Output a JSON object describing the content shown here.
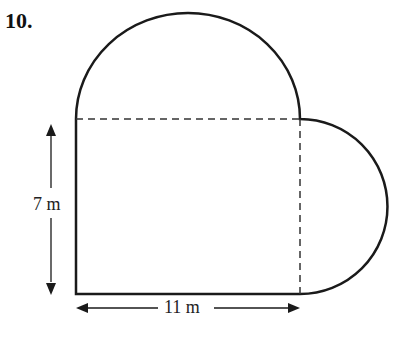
{
  "problem": {
    "number": "10."
  },
  "dimensions": {
    "height_label": "7 m",
    "width_label": "11 m"
  },
  "shape": {
    "description": "Rectangle with semicircle on top and semicircle on right side",
    "rectangle": {
      "width_m": 11,
      "height_m": 7
    },
    "top_semicircle_diameter_m": 11,
    "right_semicircle_diameter_m": 7
  },
  "colors": {
    "stroke": "#1a1a1a",
    "dashed": "#333333",
    "background": "#ffffff"
  }
}
